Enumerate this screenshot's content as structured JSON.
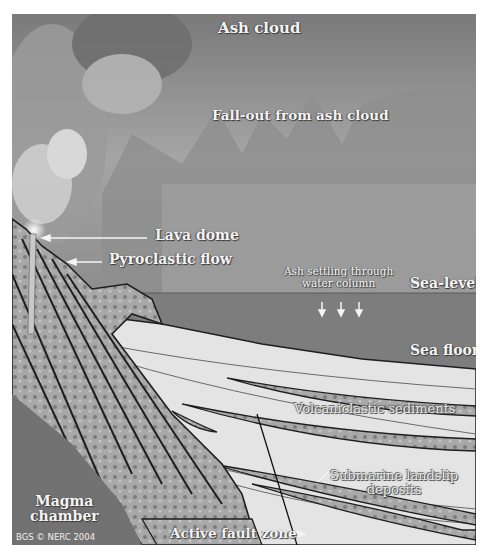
{
  "figure": {
    "labels": {
      "ash_cloud": "Ash cloud",
      "fallout": "Fall-out from ash cloud",
      "lava_dome": "Lava dome",
      "pyroclastic_flow": "Pyroclastic flow",
      "ash_settling_line1": "Ash settling through",
      "ash_settling_line2": "water column",
      "sea_level": "Sea-level",
      "sea_floor": "Sea floor",
      "volcaniclastic": "Volcaniclastic sediments",
      "landslip_line1": "Submarine landslip",
      "landslip_line2": "deposits",
      "magma_line1": "Magma",
      "magma_line2": "chamber",
      "fault_zone": "Active fault zone",
      "credit": "BGS © NERC 2004"
    },
    "colors": {
      "sky": "#8f8f8f",
      "sea": "#7b7b7b",
      "sediment": "#e6e6e6",
      "rock": "#9c9c9c",
      "outline": "#1e1e1e",
      "label": "#f4f4f4"
    }
  }
}
